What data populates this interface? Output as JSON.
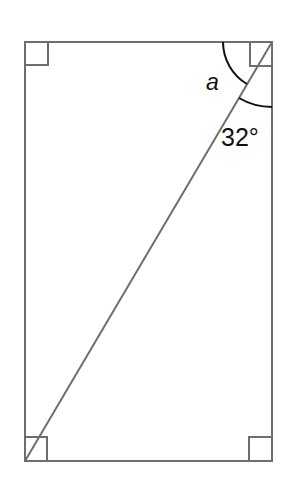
{
  "diagram": {
    "type": "geometry",
    "shape": "rectangle with diagonal",
    "labels": {
      "angle_a": "a",
      "angle_known": "32°"
    },
    "colors": {
      "outline": "#6e6e6e",
      "arc": "#111111",
      "text": "#111111"
    }
  }
}
